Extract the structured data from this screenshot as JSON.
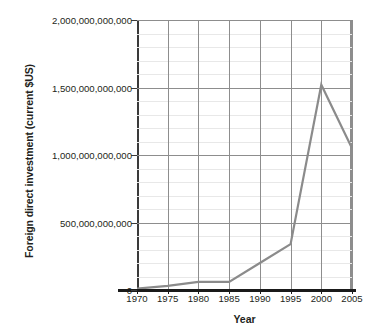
{
  "chart_data": {
    "type": "line",
    "title": "",
    "xlabel": "Year",
    "ylabel": "Foreign direct investment (current $US)",
    "x": [
      1970,
      1975,
      1980,
      1985,
      1990,
      1995,
      2000,
      2005
    ],
    "categories": [
      "1970",
      "1975",
      "1980",
      "1985",
      "1990",
      "1995",
      "2000",
      "2005"
    ],
    "values": [
      10000000000,
      30000000000,
      60000000000,
      60000000000,
      200000000000,
      340000000000,
      1520000000000,
      1050000000000
    ],
    "series": [
      {
        "name": "Foreign direct investment",
        "values": [
          10000000000,
          30000000000,
          60000000000,
          60000000000,
          200000000000,
          340000000000,
          1520000000000,
          1050000000000
        ]
      }
    ],
    "xlim": [
      1970,
      2005
    ],
    "ylim": [
      0,
      2000000000000
    ],
    "y_major_ticks": [
      0,
      500000000000,
      1000000000000,
      1500000000000,
      2000000000000
    ],
    "y_tick_labels": [
      "0",
      "500,000,000,000",
      "1,000,000,000,000",
      "1,500,000,000,000",
      "2,000,000,000,000"
    ],
    "x_tick_labels": [
      "1970",
      "1975",
      "1980",
      "1985",
      "1990",
      "1995",
      "2000",
      "2005"
    ],
    "grid": true,
    "minor_grid": true,
    "minor_ticks_per_major": 5,
    "legend": "none",
    "series_color": "#8b8b8b",
    "grid_color": "#8d8d8d",
    "minor_grid_color": "#e8e8e8",
    "axis_color": "#1a1a1a",
    "text_color": "#231f20",
    "background": "#ffffff"
  }
}
